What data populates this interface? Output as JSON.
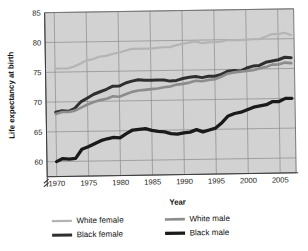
{
  "figure": {
    "background_color": "#ffffff",
    "plot_background_color": "#d2d2d2",
    "grid_color": "#8a8a8a",
    "axis_color": "#4a4a4a"
  },
  "chart_data": {
    "type": "line",
    "title": "",
    "xlabel": "Year",
    "ylabel": "Life expectancy at birth",
    "xlim": [
      1968.5,
      2007.5
    ],
    "ylim": [
      57.5,
      85
    ],
    "xticks": [
      1970,
      1975,
      1980,
      1985,
      1990,
      1995,
      2000,
      2005
    ],
    "yticks": [
      60,
      65,
      70,
      75,
      80,
      85
    ],
    "grid": true,
    "y_axis_break": true,
    "legend_position": "below",
    "series": [
      {
        "name": "White female",
        "color": "#b4b4b4",
        "x": [
          1970,
          1971,
          1972,
          1973,
          1974,
          1975,
          1976,
          1977,
          1978,
          1979,
          1980,
          1981,
          1982,
          1983,
          1984,
          1985,
          1986,
          1987,
          1988,
          1989,
          1990,
          1991,
          1992,
          1993,
          1994,
          1995,
          1996,
          1997,
          1998,
          1999,
          2000,
          2001,
          2002,
          2003,
          2004,
          2005,
          2006,
          2007
        ],
        "values": [
          75.6,
          75.6,
          75.6,
          75.9,
          76.4,
          76.9,
          77.1,
          77.5,
          77.6,
          77.9,
          78.1,
          78.4,
          78.7,
          78.7,
          78.7,
          78.7,
          78.8,
          78.9,
          78.9,
          79.2,
          79.4,
          79.6,
          79.8,
          79.5,
          79.6,
          79.6,
          79.7,
          79.9,
          79.9,
          79.9,
          79.9,
          80.0,
          80.0,
          80.4,
          80.8,
          80.8,
          81.0,
          80.6
        ]
      },
      {
        "name": "Black female",
        "color": "#2f2f2f",
        "x": [
          1970,
          1971,
          1972,
          1973,
          1974,
          1975,
          1976,
          1977,
          1978,
          1979,
          1980,
          1981,
          1982,
          1983,
          1984,
          1985,
          1986,
          1987,
          1988,
          1989,
          1990,
          1991,
          1992,
          1993,
          1994,
          1995,
          1996,
          1997,
          1998,
          1999,
          2000,
          2001,
          2002,
          2003,
          2004,
          2005,
          2006,
          2007
        ],
        "values": [
          68.3,
          68.5,
          68.4,
          68.9,
          70.0,
          70.6,
          71.2,
          71.6,
          72.0,
          72.5,
          72.5,
          73.0,
          73.3,
          73.5,
          73.4,
          73.4,
          73.4,
          73.4,
          73.2,
          73.3,
          73.6,
          73.8,
          73.9,
          73.7,
          73.9,
          73.9,
          74.2,
          74.7,
          74.8,
          74.7,
          75.2,
          75.5,
          75.6,
          76.1,
          76.3,
          76.5,
          76.9,
          76.8
        ]
      },
      {
        "name": "White male",
        "color": "#8c8c8c",
        "x": [
          1970,
          1971,
          1972,
          1973,
          1974,
          1975,
          1976,
          1977,
          1978,
          1979,
          1980,
          1981,
          1982,
          1983,
          1984,
          1985,
          1986,
          1987,
          1988,
          1989,
          1990,
          1991,
          1992,
          1993,
          1994,
          1995,
          1996,
          1997,
          1998,
          1999,
          2000,
          2001,
          2002,
          2003,
          2004,
          2005,
          2006,
          2007
        ],
        "values": [
          68.0,
          68.3,
          68.3,
          68.5,
          69.0,
          69.5,
          69.9,
          70.2,
          70.4,
          70.8,
          70.7,
          71.1,
          71.5,
          71.7,
          71.8,
          71.9,
          72.0,
          72.2,
          72.3,
          72.6,
          72.7,
          72.9,
          73.2,
          73.1,
          73.3,
          73.4,
          73.8,
          74.3,
          74.5,
          74.6,
          74.7,
          74.8,
          75.1,
          75.3,
          75.7,
          75.7,
          76.0,
          75.9
        ]
      },
      {
        "name": "Black male",
        "color": "#1a1a1a",
        "x": [
          1970,
          1971,
          1972,
          1973,
          1974,
          1975,
          1976,
          1977,
          1978,
          1979,
          1980,
          1981,
          1982,
          1983,
          1984,
          1985,
          1986,
          1987,
          1988,
          1989,
          1990,
          1991,
          1992,
          1993,
          1994,
          1995,
          1996,
          1997,
          1998,
          1999,
          2000,
          2001,
          2002,
          2003,
          2004,
          2005,
          2006,
          2007
        ],
        "values": [
          60.0,
          60.5,
          60.4,
          60.5,
          62.0,
          62.4,
          62.9,
          63.4,
          63.7,
          63.9,
          63.8,
          64.5,
          65.1,
          65.2,
          65.3,
          65.0,
          64.8,
          64.7,
          64.4,
          64.3,
          64.5,
          64.6,
          65.0,
          64.6,
          64.9,
          65.2,
          66.1,
          67.2,
          67.6,
          67.8,
          68.2,
          68.6,
          68.8,
          69.0,
          69.5,
          69.5,
          70.0,
          70.0
        ]
      }
    ]
  },
  "legend": {
    "items": [
      {
        "label": "White female",
        "color": "#b4b4b4",
        "thickness": 2.2
      },
      {
        "label": "White male",
        "color": "#8c8c8c",
        "thickness": 2.6
      },
      {
        "label": "Black female",
        "color": "#2f2f2f",
        "thickness": 3.0
      },
      {
        "label": "Black male",
        "color": "#1a1a1a",
        "thickness": 3.2
      }
    ]
  }
}
